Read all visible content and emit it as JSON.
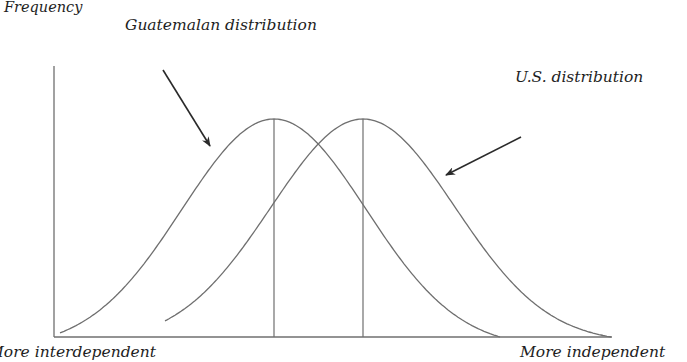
{
  "diagram": {
    "y_axis_label": "Frequency",
    "x_axis_left_label": "More interdependent",
    "x_axis_right_label": "More independent",
    "series": [
      {
        "name": "Guatemalan distribution",
        "label": "Guatemalan distribution",
        "peak_x": 274,
        "relative_position": "left"
      },
      {
        "name": "U.S. distribution",
        "label": "U.S. distribution",
        "peak_x": 363,
        "relative_position": "right"
      }
    ],
    "colors": {
      "line": "#6f6f6f",
      "arrow": "#2a2a2a",
      "text": "#1e1e1e",
      "background": "#ffffff"
    }
  }
}
